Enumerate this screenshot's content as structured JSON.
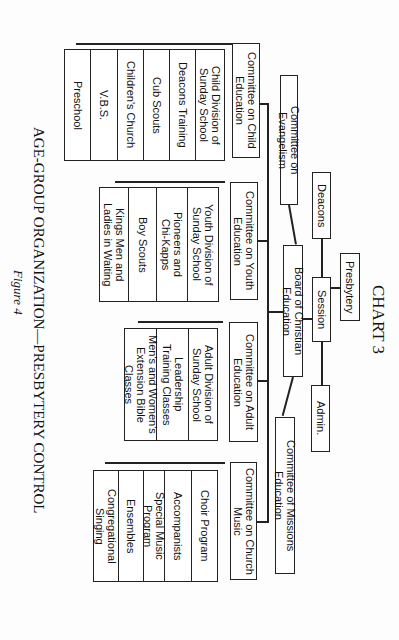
{
  "chart_title": "CHART 3",
  "caption": "AGE-GROUP ORGANIZATION—PRESBYTERY CONTROL",
  "figure_label": "Figure 4",
  "nodes": {
    "presbytery": "Presbytery",
    "session": "Session",
    "deacons": "Deacons",
    "admin": "Admin.",
    "board": "Board of Christian Education",
    "evangelism": "Committee on Evangelism",
    "missions": "Committee of Missions Education"
  },
  "committees": [
    {
      "name": "Committee on Child\nEducation",
      "items": [
        "Child Division of\nSunday School",
        "Deacons Training",
        "Cub Scouts",
        "Children's Church",
        "V.B.S.",
        "Preschool"
      ]
    },
    {
      "name": "Committee on Youth\nEducation",
      "items": [
        "Youth Division of\nSunday School",
        "Pioneers and\nChi-Kapps",
        "Boy Scouts",
        "Kings Men and\nLadies in Waiting"
      ]
    },
    {
      "name": "Committee on Adult\nEducation",
      "items": [
        "Adult Division of\nSunday School",
        "Leadership\nTraining Classes",
        "Men's and Women's\nExtension Bible Classes"
      ]
    },
    {
      "name": "Committee on Church\nMusic",
      "items": [
        "Choir Program",
        "Accompanists",
        "Special Music Program",
        "Ensembles",
        "Congregational Singing"
      ]
    }
  ]
}
